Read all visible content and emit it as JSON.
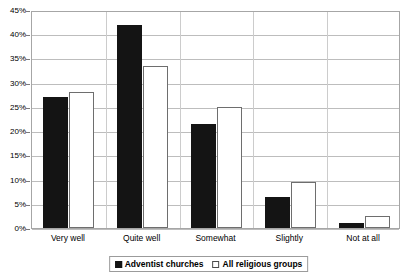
{
  "chart_data": {
    "type": "bar",
    "title": "",
    "xlabel": "",
    "ylabel": "",
    "ylim": [
      0,
      45
    ],
    "ytick_step": 5,
    "grid": true,
    "legend_position": "bottom",
    "categories": [
      "Very well",
      "Quite well",
      "Somewhat",
      "Slightly",
      "Not at all"
    ],
    "ytick_labels": [
      "45%",
      "40%",
      "35%",
      "30%",
      "25%",
      "20%",
      "15%",
      "10%",
      "5%",
      "0%"
    ],
    "series": [
      {
        "name": "Adventist churches",
        "style": "solid-black",
        "color": "#141414",
        "values": [
          27,
          42,
          21.5,
          6.5,
          1
        ]
      },
      {
        "name": "All religious groups",
        "style": "open-white",
        "color": "#ffffff",
        "values": [
          28,
          33.5,
          25,
          9.5,
          2.5
        ]
      }
    ]
  },
  "legend": {
    "entries": [
      {
        "label": "Adventist churches",
        "swatch": "filled-square-icon"
      },
      {
        "label": "All religious groups",
        "swatch": "empty-square-icon"
      }
    ]
  },
  "axes": {
    "y_max_label": "45%",
    "y_min_label": "0%"
  }
}
